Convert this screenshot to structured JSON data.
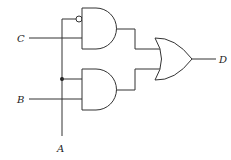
{
  "diagram": {
    "type": "logic-circuit",
    "inputs": [
      {
        "id": "C",
        "label": "C"
      },
      {
        "id": "B",
        "label": "B"
      },
      {
        "id": "A",
        "label": "A"
      }
    ],
    "output": {
      "id": "D",
      "label": "D"
    },
    "gates": [
      {
        "id": "and1",
        "type": "AND",
        "inputs": [
          "NOT A",
          "C"
        ]
      },
      {
        "id": "and2",
        "type": "AND",
        "inputs": [
          "A",
          "B"
        ]
      },
      {
        "id": "or1",
        "type": "OR",
        "inputs": [
          "and1",
          "and2"
        ],
        "output": "D"
      }
    ],
    "colors": {
      "line": "#333333",
      "background": "#ffffff"
    }
  }
}
